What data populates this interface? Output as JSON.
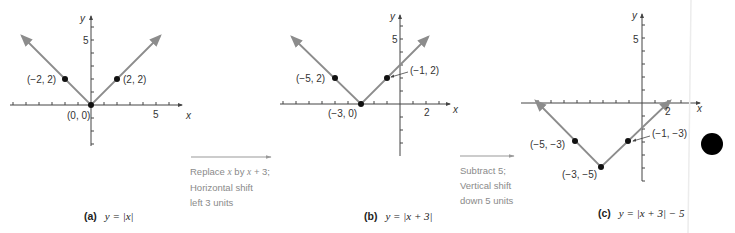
{
  "panels": [
    {
      "id": "a",
      "tag": "(a)",
      "equation": "y = |x|",
      "axis_x_label": "x",
      "axis_y_label": "y",
      "tick_labels": {
        "x": "5",
        "y": "5"
      },
      "points": [
        {
          "label": "(−2, 2)",
          "x": -2,
          "y": 2
        },
        {
          "label": "(0, 0)",
          "x": 0,
          "y": 0
        },
        {
          "label": "(2, 2)",
          "x": 2,
          "y": 2
        }
      ]
    },
    {
      "id": "b",
      "tag": "(b)",
      "equation": "y = |x + 3|",
      "axis_x_label": "x",
      "axis_y_label": "y",
      "tick_labels": {
        "x": "2",
        "y": "5"
      },
      "points": [
        {
          "label": "(−5, 2)",
          "x": -5,
          "y": 2
        },
        {
          "label": "(−3, 0)",
          "x": -3,
          "y": 0
        },
        {
          "label": "(−1, 2)",
          "x": -1,
          "y": 2
        }
      ]
    },
    {
      "id": "c",
      "tag": "(c)",
      "equation": "y = |x + 3| − 5",
      "axis_x_label": "x",
      "axis_y_label": "y",
      "tick_labels": {
        "x": "2",
        "y": "5"
      },
      "points": [
        {
          "label": "(−5, −3)",
          "x": -5,
          "y": -3
        },
        {
          "label": "(−3, −5)",
          "x": -3,
          "y": -5
        },
        {
          "label": "(−1, −3)",
          "x": -1,
          "y": -3
        }
      ]
    }
  ],
  "transforms": [
    {
      "line1_pre": "Replace ",
      "line1_var1": "x",
      "line1_mid": " by ",
      "line1_var2": "x",
      "line1_post": " + 3;",
      "line2": "Horizontal shift",
      "line3": "left 3 units"
    },
    {
      "line1_pre": "Subtract 5;",
      "line2": "Vertical shift",
      "line3": "down 5 units"
    }
  ],
  "colors": {
    "graph_line": "#8c8c8c",
    "axis": "#444444",
    "point": "#111111",
    "note_text": "#8a8a8a"
  }
}
